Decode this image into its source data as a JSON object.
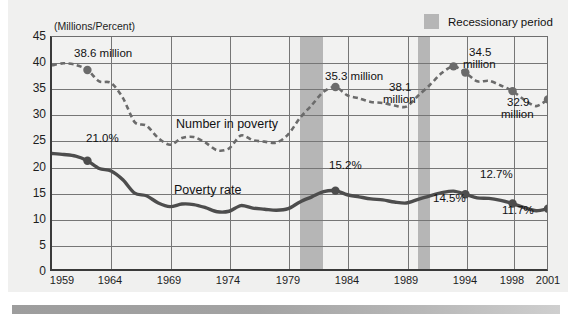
{
  "chart_data": {
    "type": "line",
    "title": "",
    "subtitle": "",
    "ylabel": "(Millions/Percent)",
    "xlabel": "",
    "ylim": [
      0,
      45
    ],
    "xlim": [
      1959,
      2001
    ],
    "grid": true,
    "legend_position": "top-right",
    "ytick_labels": [
      "0",
      "5",
      "10",
      "15",
      "20",
      "25",
      "30",
      "35",
      "40",
      "45"
    ],
    "ytick_values": [
      0,
      5,
      10,
      15,
      20,
      25,
      30,
      35,
      40,
      45
    ],
    "xtick_labels": [
      "1959",
      "1964",
      "1969",
      "1974",
      "1979",
      "1984",
      "1989",
      "1994",
      "1998",
      "2001"
    ],
    "xtick_values": [
      1959,
      1964,
      1969,
      1974,
      1979,
      1984,
      1989,
      1994,
      1998,
      2001
    ],
    "x": [
      1959,
      1960,
      1961,
      1962,
      1963,
      1964,
      1965,
      1966,
      1967,
      1968,
      1969,
      1970,
      1971,
      1972,
      1973,
      1974,
      1975,
      1976,
      1977,
      1978,
      1979,
      1980,
      1981,
      1982,
      1983,
      1984,
      1985,
      1986,
      1987,
      1988,
      1989,
      1990,
      1991,
      1992,
      1993,
      1994,
      1995,
      1996,
      1997,
      1998,
      1999,
      2000,
      2001
    ],
    "series": [
      {
        "name": "Number in poverty",
        "unit": "millions",
        "style": "dashed",
        "color": "#6b6b6b",
        "values": [
          39.5,
          39.9,
          39.6,
          38.6,
          36.4,
          36.1,
          33.2,
          28.5,
          27.8,
          25.4,
          24.1,
          25.4,
          25.6,
          24.5,
          23.0,
          23.4,
          25.9,
          25.0,
          24.7,
          24.5,
          26.1,
          29.3,
          31.8,
          34.4,
          35.3,
          33.7,
          33.1,
          32.4,
          32.2,
          31.7,
          31.5,
          33.6,
          35.7,
          38.0,
          39.3,
          38.1,
          36.4,
          36.5,
          35.6,
          34.5,
          32.8,
          31.6,
          32.9
        ]
      },
      {
        "name": "Poverty rate",
        "unit": "percent",
        "style": "solid",
        "color": "#4d4d4d",
        "values": [
          22.4,
          22.2,
          21.9,
          21.0,
          19.5,
          19.0,
          17.3,
          14.7,
          14.2,
          12.8,
          12.1,
          12.6,
          12.5,
          11.9,
          11.1,
          11.2,
          12.3,
          11.8,
          11.6,
          11.4,
          11.7,
          13.0,
          14.0,
          15.0,
          15.2,
          14.4,
          14.0,
          13.6,
          13.4,
          13.0,
          12.8,
          13.5,
          14.2,
          14.8,
          15.1,
          14.5,
          13.8,
          13.7,
          13.3,
          12.7,
          11.9,
          11.3,
          11.7
        ]
      }
    ],
    "markers": [
      {
        "series": "Number in poverty",
        "year": 1962,
        "value": 38.6,
        "label": "38.6 million"
      },
      {
        "series": "Number in poverty",
        "year": 1983,
        "value": 35.3,
        "label": "35.3 million"
      },
      {
        "series": "Number in poverty",
        "year": 1993,
        "value": 39.3,
        "label": "38.1 million"
      },
      {
        "series": "Number in poverty",
        "year": 1994,
        "value": 38.1,
        "label": ""
      },
      {
        "series": "Number in poverty",
        "year": 1998,
        "value": 34.5,
        "label": "34.5 million"
      },
      {
        "series": "Number in poverty",
        "year": 2001,
        "value": 32.9,
        "label": "32.9 million"
      },
      {
        "series": "Poverty rate",
        "year": 1962,
        "value": 21.0,
        "label": "21.0%"
      },
      {
        "series": "Poverty rate",
        "year": 1983,
        "value": 15.2,
        "label": "15.2%"
      },
      {
        "series": "Poverty rate",
        "year": 1994,
        "value": 14.5,
        "label": "14.5%"
      },
      {
        "series": "Poverty rate",
        "year": 1998,
        "value": 12.7,
        "label": "12.7%"
      },
      {
        "series": "Poverty rate",
        "year": 2001,
        "value": 11.7,
        "label": "11.7%"
      }
    ],
    "annotations": [
      {
        "id": "a1",
        "text": "38.6 million"
      },
      {
        "id": "a2",
        "text": "21.0%"
      },
      {
        "id": "a3",
        "text": "35.3 million"
      },
      {
        "id": "a4",
        "text": "38.1"
      },
      {
        "id": "a5",
        "text": "million"
      },
      {
        "id": "a6",
        "text": "34.5"
      },
      {
        "id": "a7",
        "text": "million"
      },
      {
        "id": "a8",
        "text": "32.9"
      },
      {
        "id": "a9",
        "text": "million"
      },
      {
        "id": "a10",
        "text": "15.2%"
      },
      {
        "id": "a11",
        "text": "14.5%"
      },
      {
        "id": "a12",
        "text": "12.7%"
      },
      {
        "id": "a13",
        "text": "11.7%"
      }
    ],
    "series_inline_labels": [
      {
        "id": "s1",
        "text": "Number in poverty"
      },
      {
        "id": "s2",
        "text": "Poverty rate"
      }
    ],
    "shaded_regions": [
      {
        "label": "Recessionary period",
        "start": 1980,
        "end": 1982,
        "color": "#b6b6b6"
      },
      {
        "label": "Recessionary period",
        "start": 1990,
        "end": 1991,
        "color": "#b6b6b6"
      }
    ],
    "legend": {
      "swatch_color": "#b6b6b6",
      "entries": [
        {
          "label": "Recessionary period",
          "type": "shaded-band"
        }
      ]
    }
  },
  "colors": {
    "page_background": "#ffffff",
    "panel_background": "#f0f0ef",
    "plot_background": "#f2f2f1",
    "grid": "#767676",
    "axis": "#3a3a3a",
    "recession_band": "#b6b6b6",
    "number_series": "#6b6b6b",
    "rate_series": "#4d4d4d",
    "text": "#111111"
  }
}
